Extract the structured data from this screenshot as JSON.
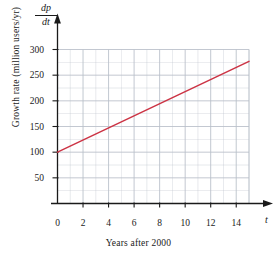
{
  "chart_data": {
    "type": "line",
    "title": "",
    "xlabel": "Years after 2000",
    "ylabel": "Growth rate (million users/yr)",
    "y_axis_symbol_numerator": "dp",
    "y_axis_symbol_denominator": "dt",
    "x_axis_variable": "t",
    "xlim": [
      0,
      15
    ],
    "ylim": [
      0,
      300
    ],
    "xticks": [
      0,
      2,
      4,
      6,
      8,
      10,
      12,
      14
    ],
    "yticks": [
      50,
      100,
      150,
      200,
      250,
      300
    ],
    "xtick_labels": [
      "0",
      "2",
      "4",
      "6",
      "8",
      "10",
      "12",
      "14"
    ],
    "ytick_labels": [
      "50",
      "100",
      "150",
      "200",
      "250",
      "300"
    ],
    "x_minor_step": 1,
    "y_minor_step": 25,
    "grid": true,
    "legend": "none",
    "series": [
      {
        "name": "growth rate",
        "color": "#cc3344",
        "x": [
          0,
          15
        ],
        "values": [
          100,
          277
        ]
      }
    ],
    "line_slope_per_year": 11.8,
    "line_intercept": 100,
    "axis_arrows": true,
    "grid_color": "#b9bfc9",
    "axis_color": "#1a1a1a"
  }
}
